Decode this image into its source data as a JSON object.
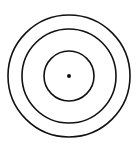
{
  "diagram": {
    "type": "concentric-circles",
    "center": {
      "x": 69,
      "y": 76
    },
    "stroke_color": "#111111",
    "background": "#ffffff",
    "circles": [
      {
        "name": "outer",
        "r": 61
      },
      {
        "name": "middle",
        "r": 47
      },
      {
        "name": "inner",
        "r": 25
      }
    ],
    "center_dot": {
      "r": 2
    }
  }
}
